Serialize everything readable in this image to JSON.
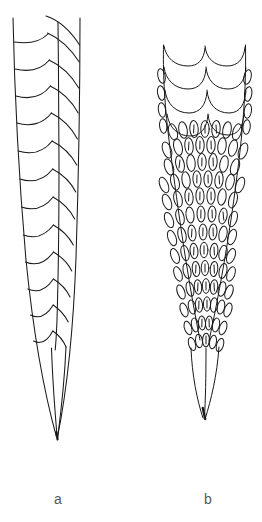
{
  "figure": {
    "background_color": "#ffffff",
    "ink_color": "#1a1a1a",
    "label_color": "#58585a",
    "width": 262,
    "height": 522,
    "caption_labels": [
      {
        "id": "a",
        "text": "a"
      },
      {
        "id": "b",
        "text": "b"
      }
    ],
    "panels": [
      {
        "id": "a",
        "label": "a",
        "description": "smooth-scaled tapering appendage",
        "outline": {
          "top_y": 18,
          "tip_y": 440,
          "top_left_x": 13,
          "top_right_x": 80,
          "tip_x": 57
        },
        "scale_style": "arc",
        "scale_row_count": 13,
        "column_count": 2
      },
      {
        "id": "b",
        "label": "b",
        "description": "dense leaf-scaled tapering appendage",
        "outline": {
          "top_y": 45,
          "tip_y": 420,
          "top_left_x": 163,
          "top_right_x": 245,
          "tip_x": 205
        },
        "scale_style": "leaf-with-slit",
        "large_scale_rows": 3,
        "small_scale_rows": 16
      }
    ]
  }
}
